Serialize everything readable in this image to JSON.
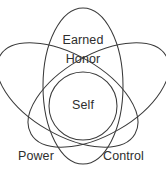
{
  "figure": {
    "background_color": "#ffffff",
    "stroke_color": "#3a3a3a",
    "text_color": "#2e2e2e",
    "labels": {
      "top_line1": "Earned",
      "top_line2": "Honor",
      "center": "Self",
      "bottom_left": "Power",
      "bottom_right": "Control"
    },
    "caption": ""
  }
}
